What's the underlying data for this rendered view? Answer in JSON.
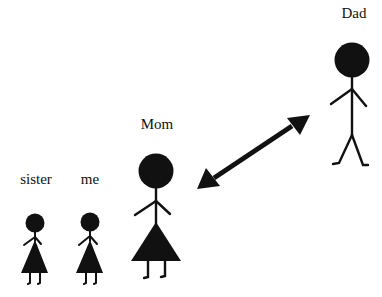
{
  "figures": [
    {
      "id": "sister",
      "label": "sister",
      "type": "female",
      "size": "small"
    },
    {
      "id": "me",
      "label": "me",
      "type": "female",
      "size": "small"
    },
    {
      "id": "mom",
      "label": "Mom",
      "type": "female",
      "size": "large"
    },
    {
      "id": "dad",
      "label": "Dad",
      "type": "male",
      "size": "large"
    }
  ],
  "relationships": [
    {
      "from": "mom",
      "to": "dad",
      "kind": "double-headed-arrow"
    }
  ],
  "colors": {
    "ink": "#111111",
    "background": "#ffffff"
  }
}
